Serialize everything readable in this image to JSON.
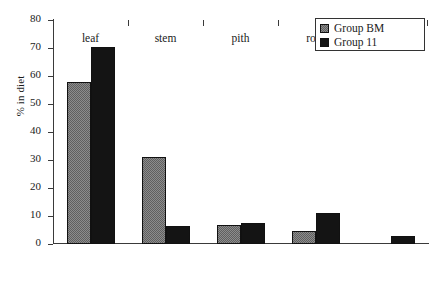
{
  "chart_data": {
    "type": "bar",
    "title": "",
    "subtitle": "",
    "xlabel": "",
    "ylabel": "% in diet",
    "categories": [
      "leaf",
      "stem",
      "pith",
      "root",
      "shoot"
    ],
    "series": [
      {
        "name": "Group BM",
        "values": [
          58,
          31,
          6.8,
          4.7,
          0
        ],
        "color": "#8c8c8c",
        "fill": "checker-gray"
      },
      {
        "name": "Group 11",
        "values": [
          70.5,
          6.5,
          7.5,
          11,
          3
        ],
        "color": "#141414",
        "fill": "solid-black"
      }
    ],
    "ylim": [
      0,
      80
    ],
    "yticks": [
      0,
      10,
      20,
      30,
      40,
      50,
      60,
      70,
      80
    ],
    "ytick_labels": [
      "0",
      "10",
      "20",
      "30",
      "40",
      "50",
      "60",
      "70",
      "80"
    ],
    "grid": false,
    "legend_position": "top-right",
    "legend_entries": [
      "Group BM",
      "Group 11"
    ]
  },
  "axis": {
    "y_title": "% in diet"
  },
  "legend": {
    "items": [
      {
        "label": "Group BM"
      },
      {
        "label": "Group 11"
      }
    ]
  }
}
